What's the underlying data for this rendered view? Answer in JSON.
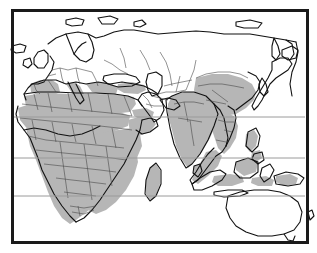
{
  "figure": {
    "type": "thematic-world-map",
    "title": "",
    "projection": "equirectangular",
    "hemisphere": "Eastern Hemisphere"
  },
  "style": {
    "background_color": "#ffffff",
    "frame_color": "#1a1a1a",
    "frame_width_px": 3,
    "gridline_color": "#9a9a9a",
    "gridline_width_px": 1,
    "coastline_color": "#111111",
    "country_border_color": "#4a4a4a",
    "shaded_fill": "#b6b6b6",
    "unshaded_fill": "#ffffff",
    "ocean_fill": "#ffffff"
  },
  "frame": {
    "left_px": 11,
    "top_px": 9,
    "right_px": 306,
    "bottom_px": 241
  },
  "gridlines": {
    "orientation": "horizontal",
    "label": "latitude lines",
    "y_positions_px": [
      117,
      158,
      196
    ]
  },
  "legend": {
    "visible": false,
    "entries": [
      {
        "swatch": "#b6b6b6",
        "label": "shaded countries"
      },
      {
        "swatch": "#ffffff",
        "label": "unshaded countries"
      }
    ]
  },
  "regions": {
    "shaded": [
      "Sub-Saharan Africa",
      "West Africa",
      "Central Africa",
      "East Africa",
      "Southern Africa",
      "Madagascar",
      "Morocco",
      "Algeria",
      "Tunisia",
      "Egypt",
      "Spain",
      "Portugal",
      "Italy",
      "Greece",
      "Turkey",
      "India",
      "Pakistan",
      "Bangladesh",
      "Sri Lanka",
      "China",
      "Indochina",
      "Thailand",
      "Vietnam",
      "Malaysia",
      "Indonesia",
      "Philippines",
      "Papua New Guinea"
    ],
    "unshaded": [
      "Northern Europe",
      "Scandinavia",
      "United Kingdom",
      "Ireland",
      "France",
      "Germany",
      "Poland",
      "Russia",
      "Kazakhstan",
      "Mongolia",
      "Japan",
      "Korea",
      "Saudi Arabia",
      "Iran",
      "Australia",
      "New Zealand",
      "Iceland",
      "Svalbard"
    ]
  }
}
